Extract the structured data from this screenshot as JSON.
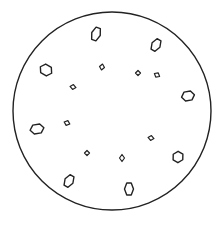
{
  "diagram": {
    "stroke_color": "#222222",
    "background": "#ffffff",
    "circle": {
      "cx": 112,
      "cy": 111,
      "r": 99
    },
    "shapes": [
      {
        "kind": "hexagon",
        "cx": 96,
        "cy": 34,
        "w": 9,
        "h": 13,
        "rot": 20
      },
      {
        "kind": "hexagon",
        "cx": 156,
        "cy": 45,
        "w": 9,
        "h": 12,
        "rot": 30
      },
      {
        "kind": "hexagon",
        "cx": 46,
        "cy": 70,
        "w": 13,
        "h": 10,
        "rot": 30
      },
      {
        "kind": "diamond",
        "cx": 102,
        "cy": 67,
        "w": 5,
        "h": 6,
        "rot": 10
      },
      {
        "kind": "diamond",
        "cx": 138,
        "cy": 73,
        "w": 5,
        "h": 5,
        "rot": 0
      },
      {
        "kind": "diamond",
        "cx": 73,
        "cy": 87,
        "w": 6,
        "h": 5,
        "rot": 10
      },
      {
        "kind": "diamond",
        "cx": 157,
        "cy": 75,
        "w": 6,
        "h": 5,
        "rot": 30
      },
      {
        "kind": "hexagon",
        "cx": 188,
        "cy": 96,
        "w": 13,
        "h": 9,
        "rot": -10
      },
      {
        "kind": "hexagon",
        "cx": 37,
        "cy": 129,
        "w": 14,
        "h": 9,
        "rot": -10
      },
      {
        "kind": "diamond",
        "cx": 67,
        "cy": 123,
        "w": 6,
        "h": 5,
        "rot": 20
      },
      {
        "kind": "diamond",
        "cx": 151,
        "cy": 138,
        "w": 6,
        "h": 5,
        "rot": 10
      },
      {
        "kind": "diamond",
        "cx": 87,
        "cy": 153,
        "w": 5,
        "h": 5,
        "rot": 0
      },
      {
        "kind": "diamond",
        "cx": 122,
        "cy": 158,
        "w": 5,
        "h": 7,
        "rot": 0
      },
      {
        "kind": "hexagon",
        "cx": 178,
        "cy": 157,
        "w": 11,
        "h": 10,
        "rot": 30
      },
      {
        "kind": "hexagon",
        "cx": 69,
        "cy": 181,
        "w": 9,
        "h": 12,
        "rot": 30
      },
      {
        "kind": "hexagon",
        "cx": 129,
        "cy": 189,
        "w": 9,
        "h": 12,
        "rot": 0
      }
    ]
  }
}
